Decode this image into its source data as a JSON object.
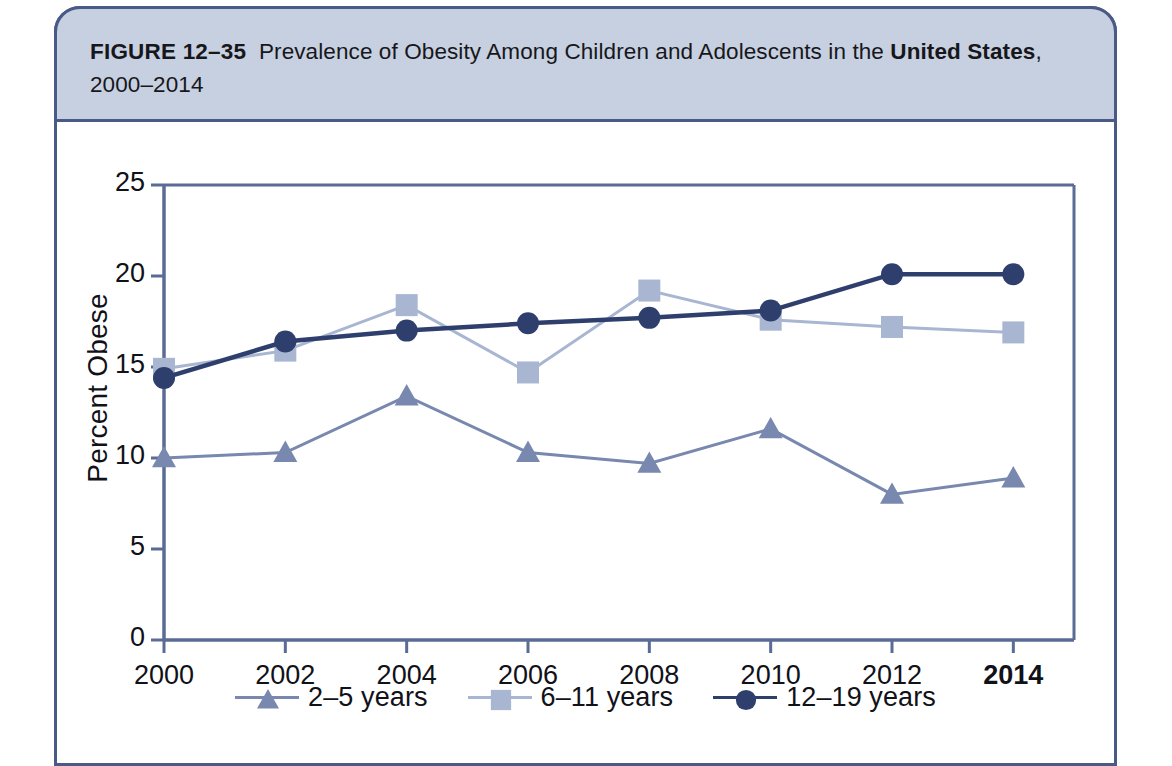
{
  "figure": {
    "label": "FIGURE 12–35",
    "caption_part1": "Prevalence of Obesity Among Children and Adolescents in the ",
    "caption_bold": "United States",
    "caption_part2": ",",
    "caption_line2": "2000–2014"
  },
  "chart_data": {
    "type": "line",
    "title": "Prevalence of Obesity Among Children and Adolescents in the United States, 2000–2014",
    "xlabel": "",
    "ylabel": "Percent Obese",
    "x": [
      2000,
      2002,
      2004,
      2006,
      2008,
      2010,
      2012,
      2014
    ],
    "categories": [
      "2000",
      "2002",
      "2004",
      "2006",
      "2008",
      "2010",
      "2012",
      "2014"
    ],
    "xlim": [
      2000,
      2015
    ],
    "ylim": [
      0,
      25
    ],
    "yticks": [
      0,
      5,
      10,
      15,
      20,
      25
    ],
    "ytick_labels": [
      "0",
      "5",
      "10",
      "15",
      "20",
      "25"
    ],
    "xticks": [
      2000,
      2002,
      2004,
      2006,
      2008,
      2010,
      2012,
      2014
    ],
    "xtick_labels": [
      "2000",
      "2002",
      "2004",
      "2006",
      "2008",
      "2010",
      "2012",
      "2014"
    ],
    "grid": false,
    "legend_position": "bottom-center",
    "series": [
      {
        "name": "2–5 years",
        "marker": "triangle",
        "color": "#7888ae",
        "line_color": "#7888ae",
        "values": [
          10.0,
          10.3,
          13.4,
          10.3,
          9.7,
          11.6,
          8.0,
          8.9
        ]
      },
      {
        "name": "6–11 years",
        "marker": "square",
        "color": "#a8b6d2",
        "line_color": "#a8b6d2",
        "values": [
          14.9,
          15.9,
          18.4,
          14.7,
          19.2,
          17.6,
          17.2,
          16.9
        ]
      },
      {
        "name": "12–19 years",
        "marker": "circle",
        "color": "#2f3f6d",
        "line_color": "#2f3f6d",
        "values": [
          14.4,
          16.4,
          17.0,
          17.4,
          17.7,
          18.1,
          20.1,
          20.1
        ]
      }
    ]
  },
  "legend": {
    "items": [
      {
        "label": "2–5 years",
        "marker": "triangle",
        "color": "#7888ae"
      },
      {
        "label": "6–11 years",
        "marker": "square",
        "color": "#a8b6d2"
      },
      {
        "label": "12–19 years",
        "marker": "circle",
        "color": "#2f3f6d"
      }
    ]
  },
  "colors": {
    "frame_border": "#4a5a86",
    "caption_band": "#c6d0e0",
    "axis": "#5a6b95",
    "series_2_5": "#7888ae",
    "series_6_11": "#a8b6d2",
    "series_12_19": "#2f3f6d",
    "text": "#111118"
  }
}
